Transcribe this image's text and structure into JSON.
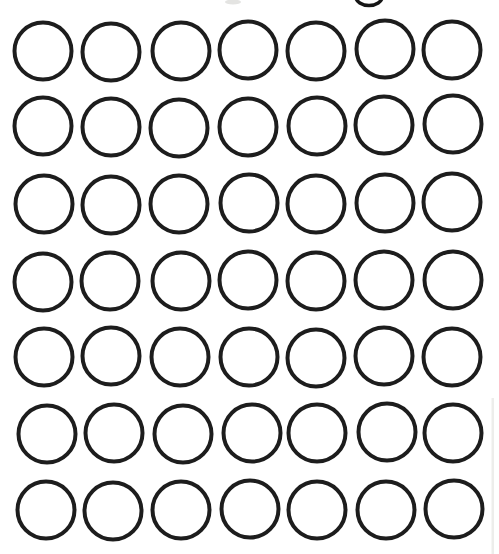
{
  "page": {
    "width": 499,
    "height": 554,
    "background_color": "#ffffff"
  },
  "worksheet": {
    "description_of_content": "grid of empty outlined circles",
    "circle_count": 49,
    "grid": {
      "rows": 7,
      "columns": 7,
      "columns_x": [
        43,
        111,
        180,
        248,
        316,
        384,
        452
      ],
      "rows_y": [
        51,
        127,
        204,
        281,
        357,
        433,
        510
      ],
      "radius": 28.5,
      "stroke_color": "#1d1d1d",
      "stroke_width": 4,
      "jitter": [
        [
          [
            0,
            0
          ],
          [
            0,
            1
          ],
          [
            1,
            0
          ],
          [
            0,
            -1
          ],
          [
            0,
            0
          ],
          [
            1,
            -2
          ],
          [
            0,
            -1
          ]
        ],
        [
          [
            0,
            -1
          ],
          [
            0,
            0
          ],
          [
            -1,
            1
          ],
          [
            0,
            0
          ],
          [
            1,
            -1
          ],
          [
            0,
            -2
          ],
          [
            1,
            -3
          ]
        ],
        [
          [
            1,
            0
          ],
          [
            0,
            1
          ],
          [
            -1,
            0
          ],
          [
            1,
            -1
          ],
          [
            0,
            0
          ],
          [
            1,
            -1
          ],
          [
            0,
            -2
          ]
        ],
        [
          [
            0,
            1
          ],
          [
            -1,
            0
          ],
          [
            1,
            0
          ],
          [
            0,
            -1
          ],
          [
            0,
            0
          ],
          [
            0,
            -1
          ],
          [
            1,
            -1
          ]
        ],
        [
          [
            1,
            0
          ],
          [
            0,
            -1
          ],
          [
            0,
            0
          ],
          [
            1,
            0
          ],
          [
            0,
            1
          ],
          [
            0,
            -1
          ],
          [
            0,
            0
          ]
        ],
        [
          [
            4,
            1
          ],
          [
            3,
            0
          ],
          [
            3,
            1
          ],
          [
            4,
            0
          ],
          [
            1,
            0
          ],
          [
            3,
            -1
          ],
          [
            1,
            0
          ]
        ],
        [
          [
            3,
            0
          ],
          [
            2,
            1
          ],
          [
            1,
            0
          ],
          [
            2,
            -1
          ],
          [
            1,
            0
          ],
          [
            2,
            0
          ],
          [
            2,
            -1
          ]
        ]
      ]
    },
    "artifacts": {
      "cropped_heading_descender": {
        "shape": "bottom arc of letter descender loop",
        "cx": 369,
        "cy": -3,
        "rx": 13,
        "ry": 8.5,
        "stroke_color": "#161616",
        "stroke_width": 3.6
      },
      "smudge": {
        "cx": 233,
        "cy": 2,
        "rx": 8,
        "ry": 2.5,
        "color": "#e4e4e2"
      },
      "right_edge_streak": {
        "x": 491.5,
        "y": 398,
        "width": 2.5,
        "height": 156,
        "color": "#ededeb"
      }
    }
  }
}
